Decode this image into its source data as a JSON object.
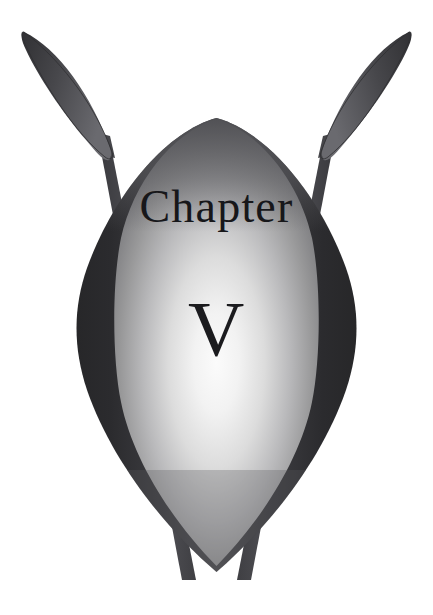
{
  "page": {
    "kind": "chapter-heading-emblem",
    "width": 433,
    "height": 615,
    "background_color": "#ffffff"
  },
  "heading": {
    "label": "Chapter",
    "numeral": "V",
    "numeral_arabic": "5",
    "text_color": "#17171a"
  },
  "emblem": {
    "name": "crossed-spears-and-shield",
    "shield": {
      "name": "vesica-shield",
      "outer_color_dark": "#2b2b2e",
      "outer_color_mid": "#56565a",
      "highlight_color": "#f4f4f4",
      "panel_edge_color": "#6f6f73"
    },
    "spears": {
      "count": 2,
      "blade_color_dark": "#3a3a3e",
      "blade_color_light": "#65656a",
      "shaft_color": "#4b4b50",
      "left_label": "left-spear",
      "right_label": "right-spear"
    }
  }
}
